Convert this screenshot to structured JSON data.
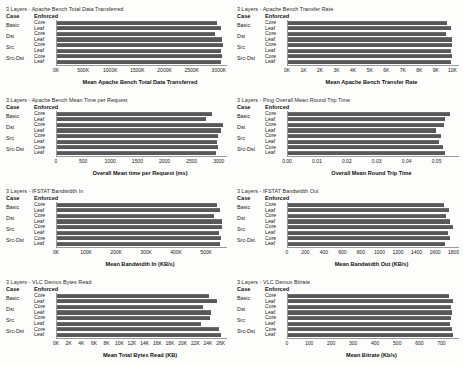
{
  "figure": {
    "columns_header": {
      "case": "Case",
      "enforced": "Enforced"
    },
    "cases": [
      "Basic",
      "Dst",
      "Src",
      "Src-Dst"
    ],
    "enforced_levels": [
      "Core",
      "Leaf"
    ],
    "bar_color": "#58585a",
    "background": "#fdfdfc"
  },
  "chart_data": [
    {
      "type": "bar",
      "orientation": "horizontal",
      "title": "3 Layers - Apache Bench Total Data Transferred",
      "xlabel": "Mean Apache Bench Total Data Transferred",
      "ylabel": "",
      "categories": [
        "Basic / Core",
        "Basic / Leaf",
        "Dst / Core",
        "Dst / Leaf",
        "Src / Core",
        "Src / Leaf",
        "Src-Dst / Core",
        "Src-Dst / Leaf"
      ],
      "values": [
        2960000,
        3030000,
        2930000,
        3060000,
        3070000,
        3040000,
        3050000,
        3030000
      ],
      "xlim": [
        0,
        3150000
      ],
      "ticks": [
        0,
        500000,
        1000000,
        1500000,
        2000000,
        2500000,
        3000000
      ],
      "ticklabels": [
        "0K",
        "500K",
        "1000K",
        "1500K",
        "2000K",
        "2500K",
        "3000K"
      ],
      "grid": false,
      "legend": "none"
    },
    {
      "type": "bar",
      "orientation": "horizontal",
      "title": "3 Layers - Apache Bench Transfer Rate",
      "xlabel": "Mean Apache Bench Transfer Rate",
      "ylabel": "",
      "categories": [
        "Basic / Core",
        "Basic / Leaf",
        "Dst / Core",
        "Dst / Leaf",
        "Src / Core",
        "Src / Leaf",
        "Src-Dst / Core",
        "Src-Dst / Leaf"
      ],
      "values": [
        9700,
        9900,
        9600,
        9950,
        10000,
        9900,
        9950,
        9900
      ],
      "xlim": [
        0,
        10400
      ],
      "ticks": [
        0,
        1000,
        2000,
        3000,
        4000,
        5000,
        6000,
        7000,
        8000,
        9000,
        10000
      ],
      "ticklabels": [
        "0K",
        "1K",
        "2K",
        "3K",
        "4K",
        "5K",
        "6K",
        "7K",
        "8K",
        "9K",
        "10K"
      ],
      "grid": false,
      "legend": "none"
    },
    {
      "type": "bar",
      "orientation": "horizontal",
      "title": "3 Layers - Apache Bench Mean Time per Request",
      "xlabel": "Overall Mean time per Request (ms)",
      "ylabel": "",
      "categories": [
        "Basic / Core",
        "Basic / Leaf",
        "Dst / Core",
        "Dst / Leaf",
        "Src / Core",
        "Src / Leaf",
        "Src-Dst / Core",
        "Src-Dst / Leaf"
      ],
      "values": [
        2870,
        2760,
        3080,
        3030,
        2980,
        2960,
        2990,
        2950
      ],
      "xlim": [
        0,
        3150
      ],
      "ticks": [
        0,
        500,
        1000,
        1500,
        2000,
        2500,
        3000
      ],
      "ticklabels": [
        "0",
        "500",
        "1000",
        "1500",
        "2000",
        "2500",
        "3000"
      ],
      "grid": false,
      "legend": "none"
    },
    {
      "type": "bar",
      "orientation": "horizontal",
      "title": "3 Layers - Ping Overall Mean Round Trip Time",
      "xlabel": "Overall Mean Round Trip Time",
      "ylabel": "",
      "categories": [
        "Basic / Core",
        "Basic / Leaf",
        "Dst / Core",
        "Dst / Leaf",
        "Src / Core",
        "Src / Leaf",
        "Src-Dst / Core",
        "Src-Dst / Leaf"
      ],
      "values": [
        0.0545,
        0.0527,
        0.0524,
        0.0497,
        0.0516,
        0.0509,
        0.0522,
        0.0529
      ],
      "xlim": [
        0,
        0.0575
      ],
      "ticks": [
        0.0,
        0.01,
        0.02,
        0.03,
        0.04,
        0.05
      ],
      "ticklabels": [
        "0.00",
        "0.01",
        "0.02",
        "0.03",
        "0.04",
        "0.05"
      ],
      "grid": false,
      "legend": "none"
    },
    {
      "type": "bar",
      "orientation": "horizontal",
      "title": "3 Layers - IFSTAT Bandwidth In",
      "xlabel": "Mean Bandwidth In (KB/s)",
      "ylabel": "",
      "categories": [
        "Basic / Core",
        "Basic / Leaf",
        "Dst / Core",
        "Dst / Leaf",
        "Src / Core",
        "Src / Leaf",
        "Src-Dst / Core",
        "Src-Dst / Leaf"
      ],
      "values": [
        537000,
        545000,
        528000,
        553000,
        552000,
        544000,
        549000,
        548000
      ],
      "xlim": [
        0,
        570000
      ],
      "ticks": [
        0,
        100000,
        200000,
        300000,
        400000,
        500000
      ],
      "ticklabels": [
        "0K",
        "100K",
        "200K",
        "300K",
        "400K",
        "500K"
      ],
      "grid": false,
      "legend": "none"
    },
    {
      "type": "bar",
      "orientation": "horizontal",
      "title": "3 Layers - IFSTAT Bandwidth Out",
      "xlabel": "Mean Bandwidth Out (KB/s)",
      "ylabel": "",
      "categories": [
        "Basic / Core",
        "Basic / Leaf",
        "Dst / Core",
        "Dst / Leaf",
        "Src / Core",
        "Src / Leaf",
        "Src-Dst / Core",
        "Src-Dst / Leaf"
      ],
      "values": [
        1700,
        1750,
        1720,
        1760,
        1790,
        1740,
        1765,
        1710
      ],
      "xlim": [
        0,
        1860
      ],
      "ticks": [
        0,
        200,
        400,
        600,
        800,
        1000,
        1200,
        1400,
        1600,
        1800
      ],
      "ticklabels": [
        "0",
        "200",
        "400",
        "600",
        "800",
        "1000",
        "1200",
        "1400",
        "1600",
        "1800"
      ],
      "grid": false,
      "legend": "none"
    },
    {
      "type": "bar",
      "orientation": "horizontal",
      "title": "3 Layers - VLC Demux Bytes Read",
      "xlabel": "Mean Total Bytes Read (KB)",
      "ylabel": "",
      "categories": [
        "Basic / Core",
        "Basic / Leaf",
        "Dst / Core",
        "Dst / Leaf",
        "Src / Core",
        "Src / Leaf",
        "Src-Dst / Core",
        "Src-Dst / Leaf"
      ],
      "values": [
        24100,
        25400,
        23200,
        24500,
        24300,
        22900,
        25800,
        26100
      ],
      "xlim": [
        0,
        27000
      ],
      "ticks": [
        0,
        2000,
        4000,
        6000,
        8000,
        10000,
        12000,
        14000,
        16000,
        18000,
        20000,
        22000,
        24000,
        26000
      ],
      "ticklabels": [
        "0K",
        "2K",
        "4K",
        "6K",
        "8K",
        "10K",
        "12K",
        "14K",
        "16K",
        "18K",
        "20K",
        "22K",
        "24K",
        "26K"
      ],
      "grid": false,
      "legend": "none"
    },
    {
      "type": "bar",
      "orientation": "horizontal",
      "title": "3 Layers - VLC Demux Bitrate",
      "xlabel": "Mean Bitrate (Kb/s)",
      "ylabel": "",
      "categories": [
        "Basic / Core",
        "Basic / Leaf",
        "Dst / Core",
        "Dst / Leaf",
        "Src / Core",
        "Src / Leaf",
        "Src-Dst / Core",
        "Src-Dst / Leaf"
      ],
      "values": [
        735,
        752,
        742,
        748,
        745,
        738,
        748,
        752
      ],
      "xlim": [
        0,
        780
      ],
      "ticks": [
        0,
        100,
        200,
        300,
        400,
        500,
        600,
        700
      ],
      "ticklabels": [
        "0",
        "100",
        "200",
        "300",
        "400",
        "500",
        "600",
        "700"
      ],
      "grid": false,
      "legend": "none"
    }
  ]
}
